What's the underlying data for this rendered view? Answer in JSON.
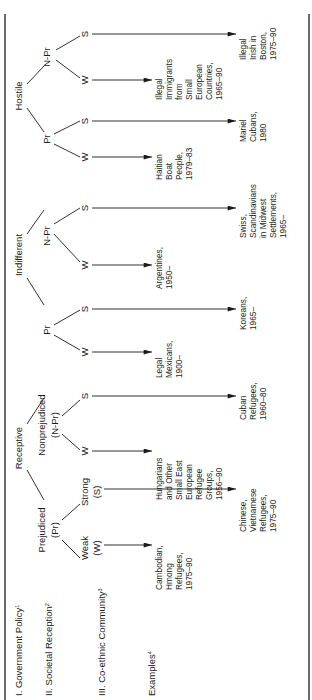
{
  "levels": {
    "policy": {
      "label": "I. Government Policy",
      "note": "1"
    },
    "reception": {
      "label": "II. Societal Reception",
      "note": "2"
    },
    "community": {
      "label": "III. Co-ethnic Community",
      "note": "3"
    },
    "examples": {
      "label": "Examples",
      "note": "4"
    }
  },
  "policies": [
    {
      "label": "Receptive",
      "branches": [
        {
          "label": "Prejudiced",
          "abbr": "(Pr)",
          "leaves": [
            {
              "label": "Weak",
              "abbr": "(W)",
              "example": [
                "Cambodian,",
                "Hmong",
                "Refugees,",
                "1975–90"
              ]
            },
            {
              "label": "Strong",
              "abbr": "(S)",
              "example": [
                "Chinese,",
                "Vietnamese",
                "Refugees,",
                "1975–90"
              ]
            }
          ]
        },
        {
          "label": "Nonprejudiced",
          "abbr": "(N-Pr)",
          "leaves": [
            {
              "label": "W",
              "example": [
                "Hungarians",
                "and Other",
                "Small East",
                "European",
                "Refugee",
                "Groups,",
                "1956–90"
              ]
            },
            {
              "label": "S",
              "example": [
                "Cuban",
                "Refugees,",
                "1960–80"
              ]
            }
          ]
        }
      ]
    },
    {
      "label": "Indifferent",
      "branches": [
        {
          "label": "Pr",
          "leaves": [
            {
              "label": "W",
              "example": [
                "Legal",
                "Mexicans,",
                "1900–"
              ]
            },
            {
              "label": "S",
              "example": [
                "Koreans,",
                "1965–"
              ]
            }
          ]
        },
        {
          "label": "N-Pr",
          "leaves": [
            {
              "label": "W",
              "example": [
                "Argentines,",
                "1950–"
              ]
            },
            {
              "label": "S",
              "example": [
                "Swiss,",
                "Scandinavians",
                "in Midwest",
                "Settlements,",
                "1965–"
              ]
            }
          ]
        }
      ]
    },
    {
      "label": "Hostile",
      "branches": [
        {
          "label": "Pr",
          "leaves": [
            {
              "label": "W",
              "example": [
                "Haitian",
                "Boat",
                "People,",
                "1979–83"
              ]
            },
            {
              "label": "S",
              "example": [
                "Mariel",
                "Cubans,",
                "1980"
              ]
            }
          ]
        },
        {
          "label": "N-Pr",
          "leaves": [
            {
              "label": "W",
              "example": [
                "Illegal",
                "Immigrants",
                "from",
                "Small",
                "European",
                "Countries,",
                "1965–90"
              ]
            },
            {
              "label": "S",
              "example": [
                "Illegal",
                "Irish in",
                "Boston,",
                "1975–90"
              ]
            }
          ]
        }
      ]
    }
  ]
}
